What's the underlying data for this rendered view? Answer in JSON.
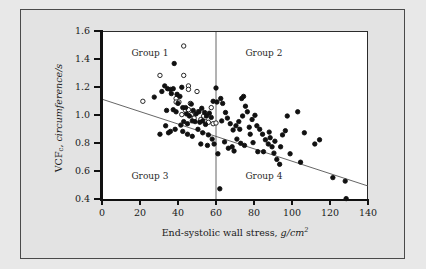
{
  "chart_data": {
    "type": "scatter",
    "title": "",
    "xlabel": "End-systolic wall stress, g/cm2",
    "xlabel_plain": "End-systolic wall stress,",
    "xlabel_units": "g/cm",
    "xlabel_exponent": "2",
    "ylabel": "VCFc, circumference/s",
    "ylabel_prefix": "VCF",
    "ylabel_sub": "c",
    "ylabel_rest": ", circumference/s",
    "xlim": [
      0,
      140
    ],
    "ylim": [
      0.4,
      1.6
    ],
    "xticks": [
      0,
      20,
      40,
      60,
      80,
      100,
      120,
      140
    ],
    "yticks": [
      0.4,
      0.6,
      0.8,
      1.0,
      1.2,
      1.4,
      1.6
    ],
    "xtick_labels": [
      "0",
      "20",
      "40",
      "60",
      "80",
      "100",
      "120",
      "140"
    ],
    "ytick_labels": [
      "0.4",
      "0.6",
      "0.8",
      "1.0",
      "1.2",
      "1.4",
      "1.6"
    ],
    "grid": false,
    "legend": "none",
    "vertical_reference_line_x": 60,
    "regression_line": {
      "x1": 0,
      "y1": 1.12,
      "x2": 140,
      "y2": 0.5
    },
    "quadrant_labels": [
      {
        "text": "Group 1",
        "x": 26,
        "y": 1.445
      },
      {
        "text": "Group 2",
        "x": 86,
        "y": 1.445
      },
      {
        "text": "Group 3",
        "x": 26,
        "y": 0.565
      },
      {
        "text": "Group 4",
        "x": 86,
        "y": 0.565
      }
    ],
    "series": [
      {
        "name": "open-circles",
        "marker": "open circle",
        "color": "#111111",
        "fill": "none",
        "points": [
          [
            21.5,
            1.105
          ],
          [
            30.5,
            1.29
          ],
          [
            43.0,
            1.5
          ],
          [
            43.0,
            1.29
          ],
          [
            45.5,
            1.215
          ],
          [
            45.5,
            1.19
          ],
          [
            50.0,
            1.175
          ],
          [
            39.0,
            1.125
          ],
          [
            39.0,
            1.1
          ],
          [
            40.5,
            1.1
          ],
          [
            46.5,
            1.09
          ],
          [
            57.5,
            1.06
          ],
          [
            44.0,
            1.04
          ],
          [
            45.5,
            1.045
          ],
          [
            47.0,
            1.01
          ],
          [
            48.5,
            0.985
          ],
          [
            52.0,
            0.975
          ],
          [
            53.5,
            1.0
          ],
          [
            54.5,
            0.96
          ],
          [
            56.0,
            0.955
          ],
          [
            58.5,
            0.945
          ],
          [
            60.0,
            0.95
          ],
          [
            42.0,
            1.01
          ],
          [
            50.5,
            1.03
          ]
        ]
      },
      {
        "name": "filled-circles",
        "marker": "filled circle",
        "color": "#111111",
        "fill": "#111111",
        "points": [
          [
            27.5,
            1.135
          ],
          [
            34.5,
            1.195
          ],
          [
            36.0,
            1.19
          ],
          [
            37.5,
            1.195
          ],
          [
            38.0,
            1.375
          ],
          [
            33.0,
            1.215
          ],
          [
            31.5,
            1.175
          ],
          [
            36.5,
            1.16
          ],
          [
            39.5,
            1.155
          ],
          [
            42.0,
            1.205
          ],
          [
            41.0,
            1.14
          ],
          [
            34.0,
            1.04
          ],
          [
            37.5,
            1.045
          ],
          [
            40.0,
            1.09
          ],
          [
            42.5,
            1.06
          ],
          [
            39.0,
            1.03
          ],
          [
            44.0,
            1.06
          ],
          [
            47.0,
            1.085
          ],
          [
            44.5,
            1.015
          ],
          [
            46.0,
            1.0
          ],
          [
            48.0,
            1.04
          ],
          [
            49.5,
            1.015
          ],
          [
            51.0,
            1.03
          ],
          [
            52.5,
            1.055
          ],
          [
            54.0,
            1.025
          ],
          [
            55.0,
            1.0
          ],
          [
            56.5,
            1.02
          ],
          [
            57.5,
            0.99
          ],
          [
            53.0,
            0.965
          ],
          [
            54.5,
            0.94
          ],
          [
            51.5,
            0.955
          ],
          [
            49.0,
            0.96
          ],
          [
            47.5,
            0.965
          ],
          [
            45.0,
            0.945
          ],
          [
            43.0,
            0.96
          ],
          [
            41.5,
            0.935
          ],
          [
            38.5,
            0.905
          ],
          [
            36.0,
            0.89
          ],
          [
            33.5,
            0.93
          ],
          [
            30.5,
            0.87
          ],
          [
            35.0,
            0.88
          ],
          [
            42.5,
            0.89
          ],
          [
            45.0,
            0.87
          ],
          [
            47.5,
            0.855
          ],
          [
            50.5,
            0.905
          ],
          [
            53.0,
            0.88
          ],
          [
            56.0,
            0.865
          ],
          [
            52.0,
            0.8
          ],
          [
            55.5,
            0.79
          ],
          [
            58.0,
            0.835
          ],
          [
            59.0,
            0.8
          ],
          [
            61.0,
            0.73
          ],
          [
            62.0,
            0.48
          ],
          [
            58.5,
            1.105
          ],
          [
            60.5,
            1.1
          ],
          [
            62.5,
            1.125
          ],
          [
            60.0,
            1.2
          ],
          [
            63.5,
            1.09
          ],
          [
            65.0,
            1.025
          ],
          [
            63.0,
            0.965
          ],
          [
            66.0,
            0.985
          ],
          [
            67.5,
            0.945
          ],
          [
            69.0,
            0.9
          ],
          [
            70.5,
            0.93
          ],
          [
            72.0,
            0.96
          ],
          [
            73.5,
            1.125
          ],
          [
            74.5,
            1.14
          ],
          [
            75.5,
            1.07
          ],
          [
            76.5,
            1.03
          ],
          [
            74.0,
            1.0
          ],
          [
            72.5,
            0.905
          ],
          [
            71.0,
            0.835
          ],
          [
            68.5,
            0.78
          ],
          [
            66.5,
            0.77
          ],
          [
            64.5,
            0.815
          ],
          [
            69.5,
            0.75
          ],
          [
            73.0,
            0.805
          ],
          [
            75.0,
            0.79
          ],
          [
            77.5,
            0.92
          ],
          [
            79.0,
            0.975
          ],
          [
            80.5,
            1.005
          ],
          [
            81.5,
            0.93
          ],
          [
            83.0,
            0.905
          ],
          [
            84.5,
            0.87
          ],
          [
            86.0,
            0.83
          ],
          [
            87.5,
            0.8
          ],
          [
            88.5,
            0.845
          ],
          [
            89.5,
            0.78
          ],
          [
            90.5,
            0.735
          ],
          [
            92.0,
            0.69
          ],
          [
            93.5,
            0.655
          ],
          [
            95.0,
            0.865
          ],
          [
            96.5,
            0.895
          ],
          [
            97.5,
            1.0
          ],
          [
            94.0,
            0.78
          ],
          [
            91.0,
            0.82
          ],
          [
            85.0,
            0.745
          ],
          [
            82.0,
            0.745
          ],
          [
            78.0,
            0.87
          ],
          [
            99.0,
            0.73
          ],
          [
            104.5,
            0.67
          ],
          [
            103.0,
            1.03
          ],
          [
            106.5,
            0.88
          ],
          [
            112.0,
            0.8
          ],
          [
            114.5,
            0.83
          ],
          [
            121.5,
            0.56
          ],
          [
            128.0,
            0.535
          ],
          [
            128.5,
            0.41
          ],
          [
            79.5,
            0.81
          ],
          [
            88.0,
            0.885
          ]
        ]
      }
    ]
  },
  "colors": {
    "background": "#e8e8e8",
    "panel": "#ffffff",
    "axis": "#111111",
    "marker": "#111111",
    "line": "#555555",
    "frame": "#4a4a4a"
  }
}
